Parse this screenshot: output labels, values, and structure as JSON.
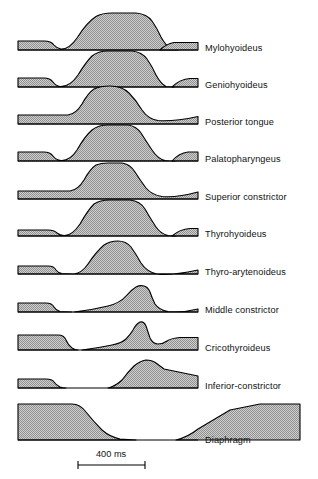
{
  "figure": {
    "fill_color": "#b3b3b3",
    "stroke_color": "#000000",
    "background": "#ffffff",
    "label_color": "#121212"
  },
  "scale": {
    "label": "400 ms",
    "value": 400,
    "unit": "ms",
    "x_start": 78,
    "x_end": 145,
    "y": 465
  },
  "traces": [
    {
      "label": "Mylohyoideus",
      "baseline_y": 50,
      "label_x": 205,
      "label_y": 44,
      "path": "M 18 50 L 18 40 L 45 40 Q 52 40 55 45 Q 58 49 62 49 Q 70 49 78 38 Q 88 22 96 16 Q 102 12 112 12 L 138 12 Q 148 13 153 20 Q 158 27 162 36 Q 167 45 172 48 Q 176 50 180 50 L 161 50 Z",
      "segments": [
        {
          "d": "M 18 50 L 18 41 L 44 41 Q 51 41 54 45 Q 57 48.5 61 49 Q 69 49.5 77 38 Q 87 22 96 16.5 Q 102 13 112 13 L 136 13 Q 147 14 152 21 Q 157 28 161 37 Q 166 46 171 49 Q 175 50 178 50 Z"
        },
        {
          "d": "M 160 50 Q 166 44 174 42.5 L 198 42.5 L 198 50 Z"
        }
      ]
    },
    {
      "label": "Geniohyoideus",
      "baseline_y": 87,
      "label_x": 205,
      "label_y": 81,
      "segments": [
        {
          "d": "M 18 87 L 18 78 L 44 78 Q 50 78 53 82 Q 56 86 60 86.5 Q 70 87 78 75 Q 86 62 92 56 Q 98 51 108 51 L 132 51 Q 142 52 147 59 Q 152 66 156 75 Q 161 84 166 86.5 Q 170 87 174 87 Z"
        },
        {
          "d": "M 172 87 Q 180 79 190 78.5 L 198 78.5 L 198 87 Z"
        }
      ]
    },
    {
      "label": "Posterior tongue",
      "baseline_y": 124,
      "label_x": 205,
      "label_y": 118,
      "segments": [
        {
          "d": "M 18 124 L 18 115 L 68 115 Q 76 114 82 104 Q 88 93 94 89 Q 100 86 110 86 Q 122 86 129 93 Q 136 100 142 110 Q 148 119 158 120.5 Q 172 122 198 116.5 L 198 124 Z"
        }
      ]
    },
    {
      "label": "Palatopharyngeus",
      "baseline_y": 161,
      "label_x": 205,
      "label_y": 155,
      "segments": [
        {
          "d": "M 18 161 L 18 152 L 44 152 Q 50 152 53 156 Q 56 160 61 160.5 Q 70 161 77 150 Q 85 136 92 130 Q 98 125 108 125 L 128 125 Q 136 126 141 133 Q 146 141 152 150 Q 158 159 165 160.5 Q 170 161 175 161 Z"
        },
        {
          "d": "M 172 161 Q 179 153 188 152 L 198 152 L 198 161 Z"
        }
      ]
    },
    {
      "label": "Superior constrictor",
      "baseline_y": 199,
      "label_x": 205,
      "label_y": 193,
      "segments": [
        {
          "d": "M 18 199 L 18 191 L 70 191 Q 78 190 84 180 Q 90 169 96 165 Q 101 163 108 163 L 122 163 Q 130 164 135 172 Q 140 180 146 188 Q 152 195 162 196.5 Q 176 198 198 192 L 198 199 Z"
        }
      ]
    },
    {
      "label": "Thyrohyoideus",
      "baseline_y": 236,
      "label_x": 205,
      "label_y": 230,
      "segments": [
        {
          "d": "M 18 236 L 18 230 L 48 230 Q 54 230 57 233 Q 60 235.5 64 235.5 Q 72 236 80 224 Q 88 210 94 204 Q 100 200 110 200 L 130 200 Q 140 201 145 209 Q 150 218 156 227 Q 161 234 168 235.5 Q 172 236 176 236 Z"
        },
        {
          "d": "M 172 236 Q 180 229 190 228.5 L 198 228.5 L 198 236 Z"
        }
      ]
    },
    {
      "label": "Thyro-arytenoideus",
      "baseline_y": 274,
      "label_x": 205,
      "label_y": 268,
      "segments": [
        {
          "d": "M 18 274 L 18 266 L 48 266 Q 54 266 56 270 Q 58 273 62 273.5 L 74 274 Q 82 273 88 264 Q 96 252 104 245 Q 110 241 118 241 Q 126 241 131 247 Q 136 254 141 263 Q 147 272 157 274 Q 170 276 198 270 L 198 274 Z"
        }
      ]
    },
    {
      "label": "Middle constrictor",
      "baseline_y": 312,
      "label_x": 205,
      "label_y": 306,
      "segments": [
        {
          "d": "M 18 312 L 18 303 L 46 303 Q 52 303 54 307 Q 56 310.5 60 311.5 L 72 312 Z"
        },
        {
          "d": "M 74 312 Q 92 310 108 306 Q 120 303 126 296 Q 131 290 136 287 Q 140 285 144 286 Q 148 287 150 292 Q 152 298 155 304 Q 159 310 168 311.5 Q 182 313 198 309 L 198 312 Z"
        }
      ]
    },
    {
      "label": "Cricothyroideus",
      "baseline_y": 350,
      "label_x": 205,
      "label_y": 344,
      "segments": [
        {
          "d": "M 18 350 L 18 335 L 58 335 Q 64 335 66 340 Q 68 345 72 348 Q 75 350 78 350 Z"
        },
        {
          "d": "M 82 350 Q 98 348 112 345 Q 122 343 126 339 Q 130 335 133 330 Q 136 324 140 322 Q 144 321 146 326 Q 148 332 150 338 Q 153 344 158 344 Q 163 344 167 341 Q 172 338 180 337.5 L 198 337.5 L 198 350 Z"
        }
      ]
    },
    {
      "label": "Inferior-constrictor",
      "baseline_y": 388,
      "label_x": 205,
      "label_y": 382,
      "segments": [
        {
          "d": "M 18 388 L 18 379 L 46 379 Q 52 379 54 382 Q 56 385 60 387 Q 63 388 66 388 Z"
        },
        {
          "d": "M 108 388 Q 116 386 122 380 Q 128 372 134 366 Q 140 361 146 360 Q 152 360 156 363 Q 160 366 164 369 L 198 376 L 198 388 Z"
        }
      ]
    },
    {
      "label": "Diaphragm",
      "baseline_y": 440,
      "label_x": 205,
      "label_y": 436,
      "segments": [
        {
          "d": "M 18 440 L 18 404 L 72 404 Q 80 404 86 412 Q 94 422 102 430 Q 110 437 120 439 L 136 440 Z"
        },
        {
          "d": "M 176 440 Q 188 437 198 429 L 230 410 L 260 404 L 300 404 L 300 440 Z"
        }
      ]
    }
  ]
}
